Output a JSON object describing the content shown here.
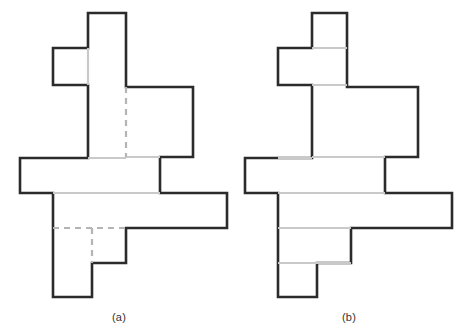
{
  "page": {
    "background_color": "#ffffff",
    "width": 467,
    "height": 333
  },
  "style": {
    "outline_color": "#2b2b2b",
    "outline_width": 2.6,
    "interior_solid_color": "#c9c9c9",
    "interior_dashed_color": "#b4b4b4",
    "interior_line_width": 2.2,
    "dash_pattern": "6,5",
    "fill_color": "#ffffff"
  },
  "figures": [
    {
      "id": "figure-a",
      "caption": "(a)",
      "caption_x": 89,
      "caption_y": 311,
      "outline": "M 88,13 L 126,13 L 126,87 L 193,87 L 193,157 L 160,157 L 160,158 L 160,158 L 160,158 L 160,158 Z",
      "outline_points": [
        [
          88,
          13
        ],
        [
          126,
          13
        ],
        [
          126,
          87
        ],
        [
          193,
          87
        ],
        [
          193,
          157
        ],
        [
          160,
          157
        ],
        [
          160,
          158
        ],
        [
          227,
          193
        ],
        [
          227,
          228
        ],
        [
          126,
          228
        ],
        [
          126,
          263
        ],
        [
          92,
          263
        ],
        [
          92,
          297
        ],
        [
          53,
          297
        ],
        [
          53,
          193
        ],
        [
          20,
          193
        ],
        [
          20,
          158
        ],
        [
          88,
          158
        ]
      ],
      "outline_path": "M 88,13 L 126,13 L 126,87 L 193,87 L 193,157 L 160,157 L 160,193 L 227,193 L 227,228 L 126,228 L 126,263 L 92,263 L 92,297 L 53,297 L 53,193 L 20,193 L 20,158 L 88,158 L 88,85 L 53,85 L 53,48 L 88,48 Z",
      "interior_lines": [
        {
          "kind": "solid",
          "x1": 88,
          "y1": 48,
          "x2": 88,
          "y2": 85
        },
        {
          "kind": "solid",
          "x1": 126,
          "y1": 157,
          "x2": 160,
          "y2": 157
        },
        {
          "kind": "solid",
          "x1": 88,
          "y1": 158,
          "x2": 126,
          "y2": 158
        },
        {
          "kind": "solid",
          "x1": 53,
          "y1": 193,
          "x2": 160,
          "y2": 193
        },
        {
          "kind": "dashed",
          "x1": 126,
          "y1": 87,
          "x2": 126,
          "y2": 157
        },
        {
          "kind": "dashed",
          "x1": 53,
          "y1": 228,
          "x2": 126,
          "y2": 228
        },
        {
          "kind": "dashed",
          "x1": 92,
          "y1": 228,
          "x2": 92,
          "y2": 263
        }
      ]
    },
    {
      "id": "figure-b",
      "caption": "(b)",
      "caption_x": 319,
      "caption_y": 311,
      "outline_path": "M 312,13 L 347,13 L 347,87 L 418,87 L 418,157 L 385,157 L 385,193 L 452,193 L 452,228 L 351,228 L 351,263 L 317,263 L 317,297 L 278,297 L 278,193 L 245,193 L 245,158 L 312,158 L 312,85 L 278,85 L 278,48 L 312,48 Z",
      "interior_lines": [
        {
          "kind": "solid",
          "x1": 312,
          "y1": 48,
          "x2": 347,
          "y2": 48
        },
        {
          "kind": "solid",
          "x1": 312,
          "y1": 85,
          "x2": 347,
          "y2": 85
        },
        {
          "kind": "solid",
          "x1": 312,
          "y1": 157,
          "x2": 385,
          "y2": 157
        },
        {
          "kind": "solid",
          "x1": 278,
          "y1": 158,
          "x2": 312,
          "y2": 158
        },
        {
          "kind": "solid",
          "x1": 278,
          "y1": 193,
          "x2": 385,
          "y2": 193
        },
        {
          "kind": "solid",
          "x1": 278,
          "y1": 228,
          "x2": 351,
          "y2": 228
        },
        {
          "kind": "solid",
          "x1": 278,
          "y1": 263,
          "x2": 351,
          "y2": 263
        }
      ]
    }
  ]
}
